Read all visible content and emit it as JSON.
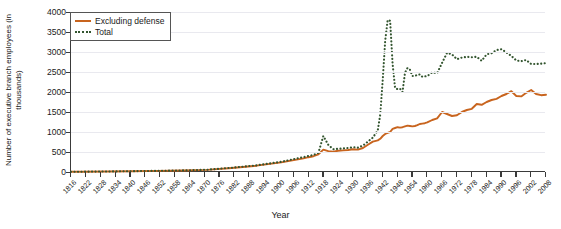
{
  "chart_data": {
    "type": "line",
    "title": "",
    "xlabel": "Year",
    "ylabel": "Number of executive branch employees (in thousands)",
    "xlim": [
      1816,
      2008
    ],
    "ylim": [
      0,
      4000
    ],
    "ytick_step": 500,
    "xtick_step": 6,
    "grid": true,
    "legend_position": "top-left",
    "ytick_labels": [
      "0",
      "500",
      "1000",
      "1500",
      "2000",
      "2500",
      "3000",
      "3500",
      "4000"
    ],
    "xtick_labels": [
      "1816",
      "1822",
      "1828",
      "1834",
      "1840",
      "1846",
      "1852",
      "1858",
      "1864",
      "1870",
      "1876",
      "1882",
      "1888",
      "1894",
      "1900",
      "1906",
      "1912",
      "1918",
      "1924",
      "1930",
      "1936",
      "1942",
      "1948",
      "1954",
      "1960",
      "1966",
      "1972",
      "1978",
      "1984",
      "1990",
      "1996",
      "2002",
      "2008"
    ],
    "series": [
      {
        "name": "Excluding defense",
        "color": "#c8641e",
        "style": "solid",
        "x": [
          1816,
          1821,
          1831,
          1841,
          1851,
          1861,
          1871,
          1881,
          1891,
          1901,
          1910,
          1912,
          1914,
          1916,
          1918,
          1920,
          1922,
          1924,
          1926,
          1928,
          1930,
          1932,
          1934,
          1936,
          1938,
          1940,
          1941,
          1942,
          1943,
          1944,
          1945,
          1946,
          1947,
          1948,
          1949,
          1950,
          1951,
          1952,
          1953,
          1954,
          1955,
          1956,
          1957,
          1958,
          1959,
          1960,
          1962,
          1964,
          1966,
          1968,
          1970,
          1972,
          1974,
          1976,
          1978,
          1980,
          1982,
          1984,
          1986,
          1988,
          1990,
          1992,
          1994,
          1996,
          1998,
          2000,
          2002,
          2004,
          2006,
          2008
        ],
        "y": [
          5,
          7,
          12,
          19,
          27,
          37,
          53,
          100,
          158,
          240,
          340,
          370,
          395,
          440,
          560,
          520,
          510,
          530,
          540,
          550,
          570,
          560,
          600,
          680,
          760,
          790,
          830,
          900,
          950,
          980,
          1000,
          1080,
          1100,
          1120,
          1110,
          1120,
          1140,
          1160,
          1150,
          1140,
          1150,
          1170,
          1200,
          1210,
          1220,
          1240,
          1300,
          1340,
          1500,
          1450,
          1400,
          1420,
          1500,
          1550,
          1580,
          1700,
          1680,
          1750,
          1800,
          1830,
          1900,
          1950,
          2020,
          1900,
          1890,
          1980,
          2050,
          1950,
          1920,
          1930
        ]
      },
      {
        "name": "Total",
        "color": "#33552f",
        "style": "dotted",
        "x": [
          1816,
          1821,
          1831,
          1841,
          1851,
          1861,
          1871,
          1881,
          1891,
          1901,
          1910,
          1912,
          1914,
          1916,
          1918,
          1920,
          1922,
          1924,
          1926,
          1928,
          1930,
          1932,
          1934,
          1936,
          1938,
          1940,
          1941,
          1942,
          1943,
          1944,
          1945,
          1946,
          1947,
          1948,
          1949,
          1950,
          1951,
          1952,
          1953,
          1954,
          1955,
          1956,
          1957,
          1958,
          1959,
          1960,
          1962,
          1964,
          1966,
          1968,
          1970,
          1972,
          1974,
          1976,
          1978,
          1980,
          1982,
          1984,
          1986,
          1988,
          1990,
          1992,
          1994,
          1996,
          1998,
          2000,
          2002,
          2004,
          2006,
          2008
        ],
        "y": [
          6,
          8,
          13,
          21,
          29,
          40,
          57,
          107,
          166,
          256,
          372,
          400,
          425,
          480,
          900,
          680,
          570,
          580,
          590,
          600,
          620,
          610,
          660,
          760,
          860,
          1040,
          1440,
          2300,
          3280,
          3800,
          3780,
          2700,
          2100,
          2070,
          2080,
          2000,
          2480,
          2600,
          2560,
          2400,
          2400,
          2430,
          2440,
          2380,
          2390,
          2400,
          2490,
          2470,
          2730,
          2980,
          2940,
          2820,
          2860,
          2880,
          2870,
          2880,
          2780,
          2940,
          2970,
          3050,
          3070,
          2990,
          2900,
          2790,
          2770,
          2800,
          2700,
          2700,
          2710,
          2720
        ]
      }
    ]
  },
  "legend": {
    "items": [
      {
        "label": "Excluding defense",
        "style": "solid",
        "color": "#c8641e"
      },
      {
        "label": "Total",
        "style": "dotted",
        "color": "#33552f"
      }
    ]
  },
  "axes": {
    "x_title": "Year",
    "y_title": "Number of executive branch employees (in thousands)"
  },
  "colors": {
    "excluding_defense": "#c8641e",
    "total": "#33552f",
    "grid": "#e9e9ef",
    "axis": "#3a3a3a",
    "text": "#1a1a1a"
  }
}
